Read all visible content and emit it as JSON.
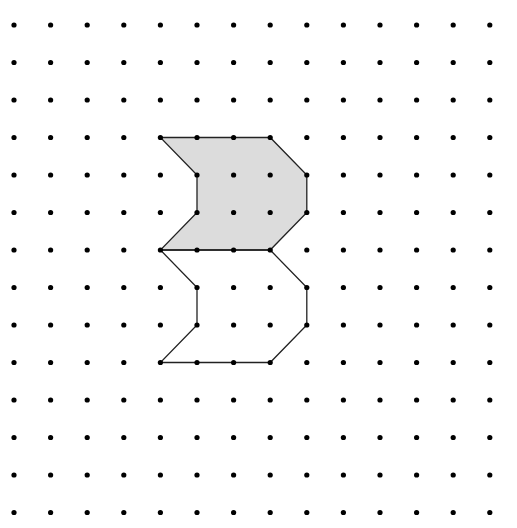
{
  "diagram": {
    "type": "dot-grid-translation",
    "grid": {
      "columns": 14,
      "rows": 14,
      "origin_x": 14,
      "origin_y": 25,
      "spacing_x": 36.6,
      "spacing_y": 37.5,
      "dot_radius": 2.6,
      "dot_color": "#000000"
    },
    "shapes": [
      {
        "name": "shaded-shape",
        "fill": "#dcdcdc",
        "stroke": "#222222",
        "vertices": [
          [
            4,
            3
          ],
          [
            7,
            3
          ],
          [
            8,
            4
          ],
          [
            8,
            5
          ],
          [
            7,
            6
          ],
          [
            4,
            6
          ],
          [
            5,
            5
          ],
          [
            5,
            4
          ]
        ]
      },
      {
        "name": "translated-outline-shape",
        "fill": "none",
        "stroke": "#222222",
        "vertices": [
          [
            4,
            6
          ],
          [
            7,
            6
          ],
          [
            8,
            7
          ],
          [
            8,
            8
          ],
          [
            7,
            9
          ],
          [
            4,
            9
          ],
          [
            5,
            8
          ],
          [
            5,
            7
          ]
        ]
      }
    ]
  }
}
